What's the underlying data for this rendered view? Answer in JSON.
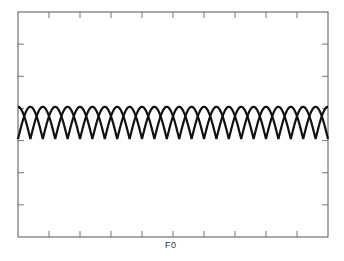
{
  "chart_data": {
    "type": "line",
    "title": "",
    "xlabel": "F0",
    "ylabel": "",
    "x_tick_labels": [
      "",
      "",
      "",
      "",
      "F0",
      "",
      "",
      "",
      ""
    ],
    "y_tick_labels": [
      "",
      "",
      "",
      "",
      "",
      ""
    ],
    "grid": false,
    "legend": null,
    "xlim": [
      0,
      1
    ],
    "ylim": [
      0,
      7
    ],
    "series": [
      {
        "name": "arches-A",
        "shape": "|sin|",
        "periods": 12.5,
        "phase": 0,
        "y_min": 3.05,
        "y_max": 4.05,
        "color": "#111111"
      },
      {
        "name": "arches-B",
        "shape": "|cos|",
        "periods": 12.5,
        "phase": 0.5,
        "y_min": 3.05,
        "y_max": 4.05,
        "color": "#111111"
      }
    ]
  },
  "colors": {
    "frame": "#555555",
    "curve": "#111111"
  }
}
